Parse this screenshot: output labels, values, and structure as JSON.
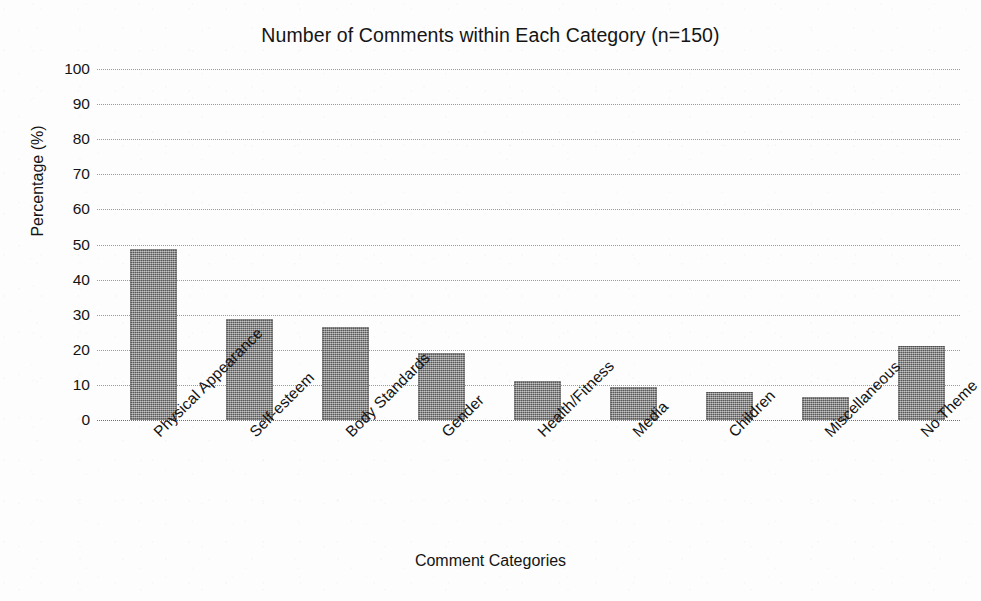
{
  "chart_data": {
    "type": "bar",
    "title": "Number of Comments within Each Category (n=150)",
    "xlabel": "Comment Categories",
    "ylabel": "Percentage (%)",
    "ylim": [
      0,
      100
    ],
    "ytick_labels": [
      "100",
      "90",
      "80",
      "70",
      "60",
      "50",
      "40",
      "30",
      "20",
      "10",
      "0"
    ],
    "ytick_values": [
      100,
      90,
      80,
      70,
      60,
      50,
      40,
      30,
      20,
      10,
      0
    ],
    "grid": "horizontal-dotted",
    "legend": "none",
    "sample_size": 150,
    "categories": [
      "Physical Appearance",
      "Self-esteem",
      "Body Standards",
      "Gender",
      "Health/Fitness",
      "Media",
      "Children",
      "Miscellaneous",
      "No Theme"
    ],
    "values": [
      48.7,
      28.7,
      26.4,
      19.2,
      11.0,
      9.3,
      8.1,
      6.6,
      21.2
    ],
    "bar_color": "#7b7b7b",
    "bar_texture": "halftone-dither-gray"
  }
}
